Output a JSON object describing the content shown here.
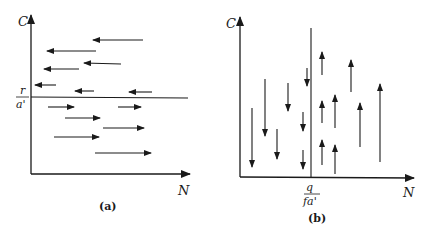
{
  "panels": [
    {
      "id": "a",
      "caption": "(a)",
      "y_axis_label": "C",
      "x_axis_label": "N",
      "isocline": {
        "orientation": "horizontal",
        "label_numerator": "r",
        "label_denominator": "a'"
      },
      "arrows_above": "pointing left (C decreases... N decreases)",
      "arrows_below": "pointing right"
    },
    {
      "id": "b",
      "caption": "(b)",
      "y_axis_label": "C",
      "x_axis_label": "N",
      "isocline": {
        "orientation": "vertical",
        "label_numerator": "q",
        "label_denominator": "fa'"
      },
      "arrows_left": "pointing down",
      "arrows_right": "pointing up"
    }
  ],
  "colors": {
    "ink": "#1a1a1a",
    "background": "#ffffff"
  }
}
